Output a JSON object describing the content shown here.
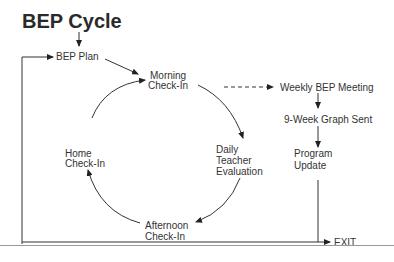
{
  "title": "BEP Cycle",
  "nodes": {
    "bep_plan": "BEP Plan",
    "morning_1": "Morning",
    "morning_2": "Check-In",
    "weekly": "Weekly BEP Meeting",
    "graph": "9-Week Graph Sent",
    "program_1": "Program",
    "program_2": "Update",
    "daily_1": "Daily",
    "daily_2": "Teacher",
    "daily_3": "Evaluation",
    "afternoon_1": "Afternoon",
    "afternoon_2": "Check-In",
    "home_1": "Home",
    "home_2": "Check-In",
    "exit": "EXIT"
  }
}
